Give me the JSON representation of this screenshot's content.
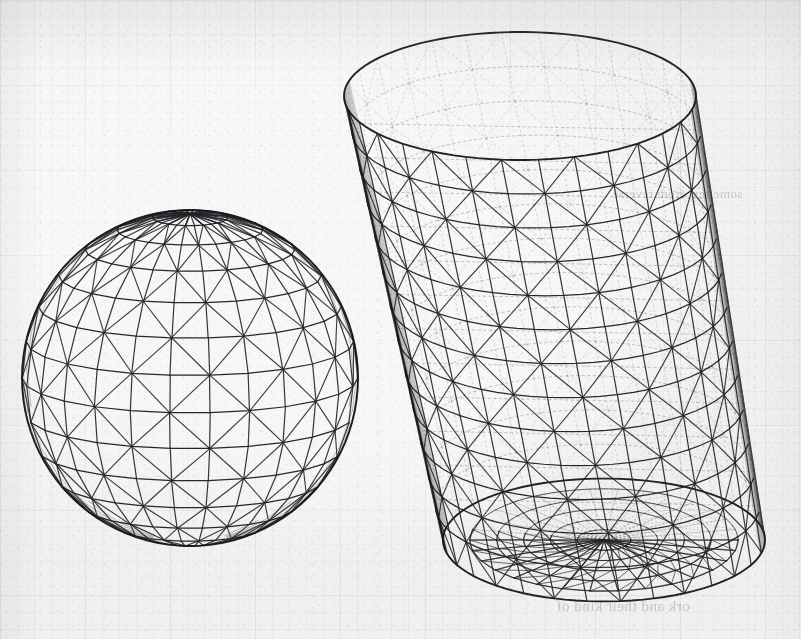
{
  "figure": {
    "kind": "scanned-paper-figure",
    "caption": "",
    "background_color": "#f7f7f5",
    "ink_color": "#24242a",
    "grid_color": "#787d87",
    "canvas": {
      "width": 801,
      "height": 639
    }
  },
  "bleed_through": {
    "upper_text": "some text from reverse",
    "lower_text": "ork and their kind of"
  },
  "objects": [
    {
      "name": "triangulated-sphere",
      "type": "sphere",
      "label": "",
      "center": {
        "x": 190,
        "y": 378
      },
      "radius": 168,
      "latitude_bands": 14,
      "longitude_segments": 26,
      "mesh": "triangulated lat-long wireframe",
      "view_tilt_deg": 12
    },
    {
      "name": "triangulated-cylinder",
      "type": "cylinder",
      "label": "",
      "axis_tilt_deg": 14,
      "top_center": {
        "x": 520,
        "y": 96
      },
      "bottom_center": {
        "x": 604,
        "y": 540
      },
      "radius_x": 176,
      "radius_y": 64,
      "height": 452,
      "circumferential_segments": 30,
      "axial_segments": 13,
      "cap_rings": 5,
      "mesh": "triangulated lateral surface with triangulated bottom cap",
      "hidden_edges_style": "dotted"
    }
  ],
  "chart_data": {
    "type": "scatter",
    "title": "",
    "xlabel": "",
    "ylabel": "",
    "note": "Geometric wireframe illustration, not a data plot"
  }
}
